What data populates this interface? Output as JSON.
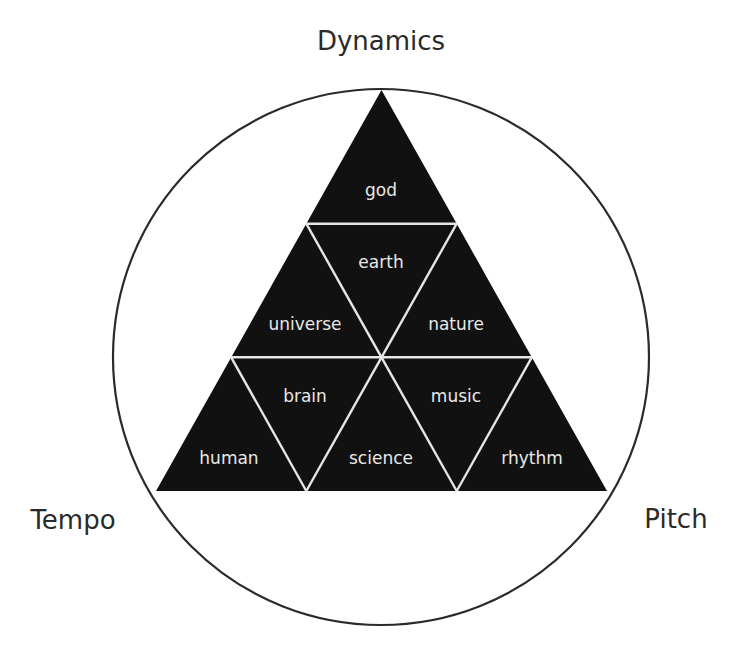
{
  "colors": {
    "background": "#ffffff",
    "triangle_fill": "#111111",
    "divider": "#e6e6e6",
    "circle_stroke": "#2a2a2a",
    "axis_text": "#2a2a2a",
    "cell_text": "#e8e8e8"
  },
  "axes": {
    "top": "Dynamics",
    "left": "Tempo",
    "right": "Pitch"
  },
  "triangle": {
    "rows": [
      {
        "cells": [
          "god"
        ]
      },
      {
        "cells": [
          "universe",
          "earth",
          "nature"
        ]
      },
      {
        "cells": [
          "human",
          "brain",
          "science",
          "music",
          "rhythm"
        ]
      }
    ]
  },
  "cells": {
    "god": "god",
    "earth": "earth",
    "universe": "universe",
    "nature": "nature",
    "brain": "brain",
    "music": "music",
    "human": "human",
    "science": "science",
    "rhythm": "rhythm"
  }
}
